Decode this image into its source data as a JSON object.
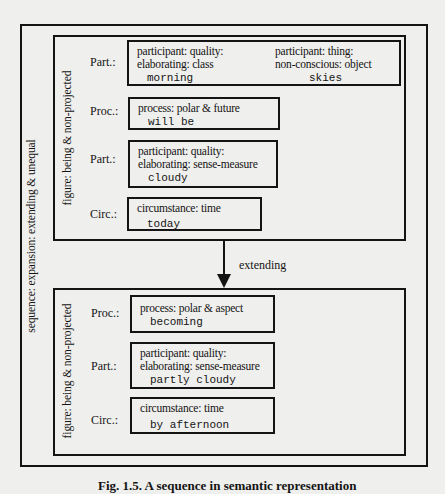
{
  "sequence_label": "sequence: expansion: extending & unequal",
  "arrow_label": "extending",
  "caption": "Fig. 1.5. A sequence in semantic representation",
  "figures": [
    {
      "label": "figure: being & non-projected",
      "elements": [
        {
          "role": "Part.:",
          "columns": [
            {
              "features": [
                "participant: quality:",
                "elaborating: class"
              ],
              "word": "morning"
            },
            {
              "features": [
                "participant: thing:",
                "non-conscious: object"
              ],
              "word": "skies"
            }
          ]
        },
        {
          "role": "Proc.:",
          "features": [
            "process: polar & future"
          ],
          "word": "will be"
        },
        {
          "role": "Part.:",
          "features": [
            "participant: quality:",
            "elaborating: sense-measure"
          ],
          "word": "cloudy"
        },
        {
          "role": "Circ.:",
          "features": [
            "circumstance: time"
          ],
          "word": "today"
        }
      ]
    },
    {
      "label": "figure: being & non-projected",
      "elements": [
        {
          "role": "Proc.:",
          "features": [
            "process: polar & aspect"
          ],
          "word": "becoming"
        },
        {
          "role": "Part.:",
          "features": [
            "participant: quality:",
            "elaborating: sense-measure"
          ],
          "word": "partly cloudy"
        },
        {
          "role": "Circ.:",
          "features": [
            "circumstance: time"
          ],
          "word": "by afternoon"
        }
      ]
    }
  ]
}
